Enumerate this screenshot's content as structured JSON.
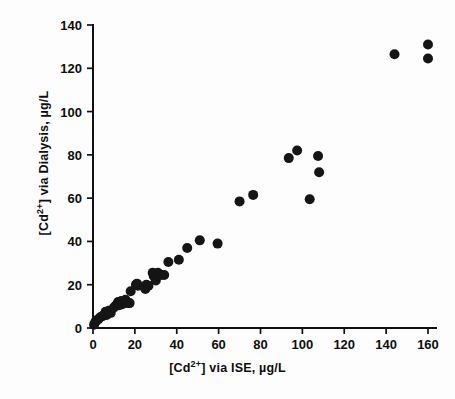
{
  "chart_data": {
    "type": "scatter",
    "title": "",
    "xlabel": "[Cd2+] via ISE, µg/L",
    "ylabel": "[Cd2+] via Dialysis, µg/L",
    "xlabel_parts": {
      "pre": "[Cd",
      "sup": "2+",
      "post": "] via ISE, µg/L"
    },
    "ylabel_parts": {
      "pre": "[Cd",
      "sup": "2+",
      "post": "] via Dialysis, µg/L"
    },
    "xlim": [
      0,
      165
    ],
    "ylim": [
      0,
      140
    ],
    "xticks": [
      0,
      20,
      40,
      60,
      80,
      100,
      120,
      140,
      160
    ],
    "yticks": [
      0,
      20,
      40,
      60,
      80,
      100,
      120,
      140
    ],
    "xticklabels": [
      "0",
      "20",
      "40",
      "60",
      "80",
      "100",
      "120",
      "140",
      "160"
    ],
    "yticklabels": [
      "0",
      "20",
      "40",
      "60",
      "80",
      "100",
      "120",
      "140"
    ],
    "grid": false,
    "legend": "none",
    "marker": "filled-circle",
    "marker_color": "#151515",
    "marker_size": 5,
    "axis_color": "#111111",
    "background": "#ffffff",
    "n_points": 46,
    "points": [
      [
        0.5,
        1.5
      ],
      [
        1.0,
        2.5
      ],
      [
        1.5,
        3.5
      ],
      [
        2.5,
        4.0
      ],
      [
        3.5,
        5.0
      ],
      [
        4.5,
        5.5
      ],
      [
        5.5,
        6.0
      ],
      [
        6.0,
        7.5
      ],
      [
        6.5,
        6.0
      ],
      [
        7.5,
        8.0
      ],
      [
        8.5,
        7.0
      ],
      [
        10.0,
        9.5
      ],
      [
        11.0,
        10.5
      ],
      [
        12.0,
        12.0
      ],
      [
        12.5,
        10.5
      ],
      [
        13.5,
        12.5
      ],
      [
        14.0,
        11.0
      ],
      [
        15.0,
        12.0
      ],
      [
        15.5,
        13.0
      ],
      [
        16.5,
        11.5
      ],
      [
        17.5,
        11.5
      ],
      [
        18.0,
        17.0
      ],
      [
        20.5,
        20.0
      ],
      [
        21.0,
        20.5
      ],
      [
        21.5,
        19.5
      ],
      [
        25.0,
        18.0
      ],
      [
        25.5,
        20.0
      ],
      [
        26.5,
        19.5
      ],
      [
        28.5,
        25.5
      ],
      [
        29.0,
        24.0
      ],
      [
        30.0,
        22.0
      ],
      [
        31.0,
        25.5
      ],
      [
        32.5,
        24.5
      ],
      [
        34.0,
        24.5
      ],
      [
        36.0,
        30.5
      ],
      [
        41.0,
        31.5
      ],
      [
        45.0,
        37.0
      ],
      [
        51.0,
        40.5
      ],
      [
        59.5,
        39.0
      ],
      [
        70.0,
        58.5
      ],
      [
        76.5,
        61.5
      ],
      [
        93.5,
        78.5
      ],
      [
        97.5,
        82.0
      ],
      [
        103.5,
        59.5
      ],
      [
        107.5,
        79.5
      ],
      [
        108.0,
        72.0
      ],
      [
        144.0,
        126.5
      ],
      [
        160.0,
        131.0
      ],
      [
        160.0,
        124.5
      ]
    ]
  },
  "axes": {
    "x_axis_name": "x-axis",
    "y_axis_name": "y-axis"
  }
}
